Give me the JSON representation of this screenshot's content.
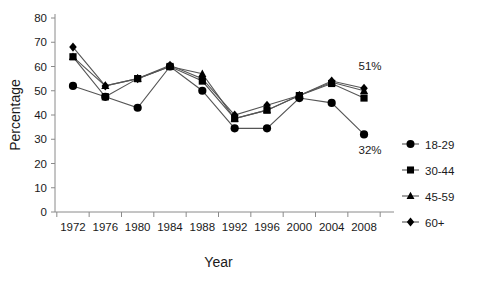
{
  "chart_data": {
    "type": "line",
    "title": "",
    "xlabel": "Year",
    "ylabel": "Percentage",
    "categories": [
      "1972",
      "1976",
      "1980",
      "1984",
      "1988",
      "1992",
      "1996",
      "2000",
      "2004",
      "2008"
    ],
    "xlim": [
      "1972",
      "2008"
    ],
    "ylim": [
      0,
      80
    ],
    "yticks": [
      0,
      10,
      20,
      30,
      40,
      50,
      60,
      70,
      80
    ],
    "grid": false,
    "legend_position": "right",
    "series": [
      {
        "name": "18-29",
        "marker": "circle",
        "values": [
          52,
          47.5,
          43,
          60,
          50,
          34.5,
          34.5,
          47,
          45,
          32
        ]
      },
      {
        "name": "30-44",
        "marker": "square",
        "values": [
          64,
          47.5,
          55,
          60,
          54,
          38.5,
          42,
          48,
          53,
          47
        ]
      },
      {
        "name": "45-59",
        "marker": "triangle",
        "values": [
          64,
          52,
          55,
          60,
          57,
          38.5,
          42,
          48,
          53.5,
          50
        ]
      },
      {
        "name": "60+",
        "marker": "diamond",
        "values": [
          68,
          52,
          55,
          60.5,
          55,
          40,
          44,
          48,
          54,
          51
        ]
      }
    ],
    "annotations": [
      {
        "label": "51%",
        "series": "60+",
        "category": "2008"
      },
      {
        "label": "32%",
        "series": "18-29",
        "category": "2008"
      }
    ]
  },
  "legend": {
    "items": [
      {
        "label": "18-29",
        "marker": "circle"
      },
      {
        "label": "30-44",
        "marker": "square"
      },
      {
        "label": "45-59",
        "marker": "triangle"
      },
      {
        "label": "60+",
        "marker": "diamond"
      }
    ]
  },
  "colors": {
    "marker": "#000000",
    "line": "#555555",
    "axis": "#8a8a8a",
    "text": "#1a1a1a",
    "background": "#ffffff"
  }
}
